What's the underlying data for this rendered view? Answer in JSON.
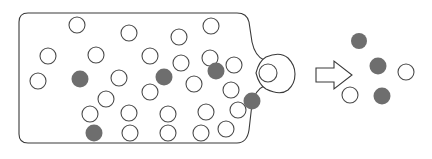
{
  "figure": {
    "type": "schematic-diagram",
    "width": 432,
    "height": 159,
    "background_color": "#ffffff"
  },
  "colors": {
    "outline": "#3a3a3a",
    "particle_outline": "#4a4a4a",
    "particle_open_fill": "#ffffff",
    "particle_filled_fill": "#6e6e6e",
    "arrow_fill": "#ffffff",
    "arrow_outline": "#3a3a3a"
  },
  "vessel": {
    "name": "container-with-neck",
    "body_path": "M 28 13 L 237 13 Q 247 13 249 22 L 252 42 Q 255 56 264 60 L 272 63 L 272 82 L 264 86 Q 255 90 252 104 L 249 130 Q 247 143 237 143 L 28 143 Q 19 143 19 134 L 19 22 Q 19 13 28 13 Z",
    "nozzle_path": "M 266 57 Q 280 51 288 58 Q 295 65 295 74 Q 295 84 288 90 Q 280 96 266 89 Q 259 85 256 73 Q 259 61 266 57 Z",
    "orifice": {
      "cx": 268,
      "cy": 73,
      "r": 9
    }
  },
  "arrow": {
    "name": "effusion-direction-arrow",
    "points": "316,68 334,68 334,61 352,75 334,89 334,82 316,82",
    "direction": "right"
  },
  "particles_inside": [
    {
      "x": 77,
      "y": 25,
      "r": 8,
      "kind": "open"
    },
    {
      "x": 129,
      "y": 33,
      "r": 8,
      "kind": "open"
    },
    {
      "x": 179,
      "y": 37,
      "r": 8,
      "kind": "open"
    },
    {
      "x": 211,
      "y": 26,
      "r": 8,
      "kind": "open"
    },
    {
      "x": 48,
      "y": 56,
      "r": 8,
      "kind": "open"
    },
    {
      "x": 96,
      "y": 55,
      "r": 8,
      "kind": "open"
    },
    {
      "x": 150,
      "y": 56,
      "r": 8,
      "kind": "open"
    },
    {
      "x": 181,
      "y": 63,
      "r": 8,
      "kind": "open"
    },
    {
      "x": 210,
      "y": 58,
      "r": 8,
      "kind": "open"
    },
    {
      "x": 234,
      "y": 65,
      "r": 8,
      "kind": "open"
    },
    {
      "x": 38,
      "y": 81,
      "r": 8,
      "kind": "open"
    },
    {
      "x": 119,
      "y": 78,
      "r": 8,
      "kind": "open"
    },
    {
      "x": 150,
      "y": 92,
      "r": 8,
      "kind": "open"
    },
    {
      "x": 194,
      "y": 84,
      "r": 8,
      "kind": "open"
    },
    {
      "x": 106,
      "y": 99,
      "r": 8,
      "kind": "open"
    },
    {
      "x": 231,
      "y": 90,
      "r": 8,
      "kind": "open"
    },
    {
      "x": 90,
      "y": 114,
      "r": 8,
      "kind": "open"
    },
    {
      "x": 129,
      "y": 113,
      "r": 8,
      "kind": "open"
    },
    {
      "x": 168,
      "y": 114,
      "r": 8,
      "kind": "open"
    },
    {
      "x": 206,
      "y": 112,
      "r": 8,
      "kind": "open"
    },
    {
      "x": 238,
      "y": 110,
      "r": 8,
      "kind": "open"
    },
    {
      "x": 130,
      "y": 133,
      "r": 8,
      "kind": "open"
    },
    {
      "x": 168,
      "y": 133,
      "r": 8,
      "kind": "open"
    },
    {
      "x": 201,
      "y": 133,
      "r": 8,
      "kind": "open"
    },
    {
      "x": 226,
      "y": 129,
      "r": 8,
      "kind": "open"
    },
    {
      "x": 80,
      "y": 79,
      "r": 8.5,
      "kind": "filled"
    },
    {
      "x": 164,
      "y": 77,
      "r": 8.5,
      "kind": "filled"
    },
    {
      "x": 216,
      "y": 71,
      "r": 8.5,
      "kind": "filled"
    },
    {
      "x": 252,
      "y": 101,
      "r": 8.5,
      "kind": "filled"
    },
    {
      "x": 94,
      "y": 133,
      "r": 8.5,
      "kind": "filled"
    }
  ],
  "particles_escaped": [
    {
      "x": 359,
      "y": 41,
      "r": 8,
      "kind": "filled"
    },
    {
      "x": 378,
      "y": 66,
      "r": 8.5,
      "kind": "filled"
    },
    {
      "x": 382,
      "y": 96,
      "r": 8.5,
      "kind": "filled"
    },
    {
      "x": 350,
      "y": 95,
      "r": 8,
      "kind": "open"
    },
    {
      "x": 406,
      "y": 72,
      "r": 8,
      "kind": "open"
    }
  ]
}
